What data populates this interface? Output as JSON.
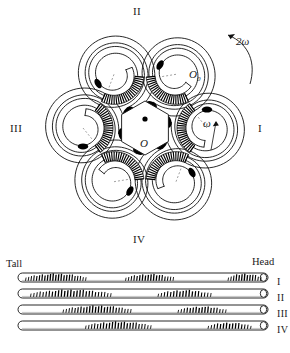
{
  "figure": {
    "title_semantic": "myosin-filament-helical-crossbridge-diagram",
    "colors": {
      "ink": "#111111",
      "paper": "#ffffff",
      "blob": "#000000",
      "dashed": "#555555"
    }
  },
  "circular_diagram": {
    "center_label": "O",
    "center_dot": "•",
    "secondary_center_label": "O",
    "secondary_center_subscript": "0",
    "inner_rotation_label": "ω",
    "outer_rotation_label": "2ω",
    "quadrant_labels": [
      {
        "name": "top",
        "text": "II"
      },
      {
        "name": "right",
        "text": "I"
      },
      {
        "name": "bottom",
        "text": "IV"
      },
      {
        "name": "left",
        "text": "III"
      }
    ],
    "spiral_count": 6,
    "spiral_turns": 2.25,
    "crossbridge_comb_count": 6
  },
  "filament_panel": {
    "left_end_label": "Tall",
    "right_end_label": "Head",
    "rows": [
      {
        "label": "I",
        "clusters": [
          {
            "start": 3,
            "end": 27,
            "density": 22,
            "max_h": 7.5
          },
          {
            "start": 43,
            "end": 62,
            "density": 17,
            "max_h": 7.0
          },
          {
            "start": 84,
            "end": 97,
            "density": 12,
            "max_h": 7.5
          }
        ]
      },
      {
        "label": "II",
        "clusters": [
          {
            "start": 5,
            "end": 37,
            "density": 26,
            "max_h": 7.5
          },
          {
            "start": 56,
            "end": 77,
            "density": 17,
            "max_h": 7.0
          }
        ]
      },
      {
        "label": "III",
        "clusters": [
          {
            "start": 18,
            "end": 45,
            "density": 23,
            "max_h": 7.5
          },
          {
            "start": 64,
            "end": 83,
            "density": 16,
            "max_h": 6.5
          }
        ]
      },
      {
        "label": "IV",
        "clusters": [
          {
            "start": 27,
            "end": 53,
            "density": 22,
            "max_h": 7.5
          },
          {
            "start": 76,
            "end": 93,
            "density": 14,
            "max_h": 6.5
          }
        ]
      }
    ]
  }
}
